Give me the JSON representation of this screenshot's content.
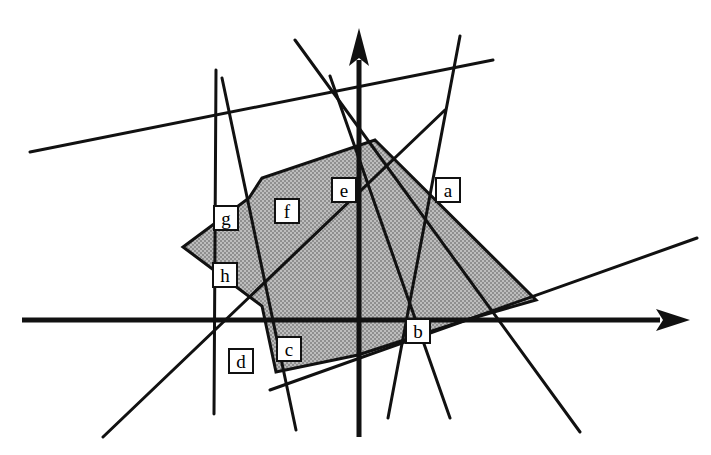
{
  "figure": {
    "kind": "geometry-diagram",
    "background_color": "#ffffff",
    "ink_color": "#111111",
    "fill_color": "#a8a8a8",
    "fill_pattern": "checker-hatch",
    "width": 711,
    "height": 455
  },
  "axes": {
    "origin": {
      "x": 358,
      "y": 320
    },
    "x_axis": {
      "name": "x-axis",
      "from": {
        "x": 22,
        "y": 320
      },
      "to": {
        "x": 660,
        "y": 320
      },
      "arrow_tip": {
        "x": 690,
        "y": 320
      },
      "stroke_width": 5,
      "arrow": "right"
    },
    "y_axis": {
      "name": "y-axis",
      "from": {
        "x": 359,
        "y": 437
      },
      "to": {
        "x": 359,
        "y": 60
      },
      "arrow_tip": {
        "x": 359,
        "y": 28
      },
      "stroke_width": 5,
      "arrow": "up"
    }
  },
  "polygon": {
    "name": "feasible-region",
    "fill": "#a8a8a8",
    "stroke": "#111111",
    "stroke_width": 3,
    "vertices": [
      {
        "id": "apex",
        "x": 375,
        "y": 140
      },
      {
        "id": "right",
        "x": 536,
        "y": 300
      },
      {
        "id": "x-axis-right",
        "x": 466,
        "y": 320
      },
      {
        "id": "bottom",
        "x": 358,
        "y": 355
      },
      {
        "id": "lower-left",
        "x": 276,
        "y": 372
      },
      {
        "id": "notch",
        "x": 262,
        "y": 306
      },
      {
        "id": "left",
        "x": 183,
        "y": 247
      },
      {
        "id": "upper-left",
        "x": 249,
        "y": 198
      },
      {
        "id": "upper-mid",
        "x": 262,
        "y": 178
      }
    ]
  },
  "lines": [
    {
      "id": "a",
      "label": "a",
      "role": "constraint-boundary",
      "from": {
        "x": 295,
        "y": 40
      },
      "to": {
        "x": 580,
        "y": 432
      },
      "stroke_width": 3
    },
    {
      "id": "b",
      "label": "b",
      "role": "constraint-boundary",
      "from": {
        "x": 270,
        "y": 390
      },
      "to": {
        "x": 697,
        "y": 238
      },
      "stroke_width": 3
    },
    {
      "id": "c",
      "label": "c",
      "role": "constraint-boundary",
      "from": {
        "x": 222,
        "y": 78
      },
      "to": {
        "x": 296,
        "y": 430
      },
      "stroke_width": 3
    },
    {
      "id": "d",
      "label": "d",
      "role": "constraint-boundary",
      "from": {
        "x": 216,
        "y": 70
      },
      "to": {
        "x": 214,
        "y": 414
      },
      "stroke_width": 3
    },
    {
      "id": "e",
      "label": "e",
      "role": "constraint-boundary",
      "from": {
        "x": 330,
        "y": 76
      },
      "to": {
        "x": 450,
        "y": 418
      },
      "stroke_width": 3
    },
    {
      "id": "f",
      "label": "f",
      "role": "constraint-boundary",
      "from": {
        "x": 460,
        "y": 36
      },
      "to": {
        "x": 388,
        "y": 418
      },
      "stroke_width": 3
    },
    {
      "id": "g",
      "label": "g",
      "role": "constraint-boundary",
      "from": {
        "x": 30,
        "y": 152
      },
      "to": {
        "x": 493,
        "y": 60
      },
      "stroke_width": 3
    },
    {
      "id": "h",
      "label": "h",
      "role": "constraint-boundary",
      "from": {
        "x": 103,
        "y": 437
      },
      "to": {
        "x": 445,
        "y": 110
      },
      "stroke_width": 3
    }
  ],
  "labels": [
    {
      "id": "a",
      "text": "a",
      "x": 435,
      "y": 177
    },
    {
      "id": "b",
      "text": "b",
      "x": 405,
      "y": 318
    },
    {
      "id": "c",
      "text": "c",
      "x": 276,
      "y": 336
    },
    {
      "id": "d",
      "text": "d",
      "x": 228,
      "y": 348
    },
    {
      "id": "e",
      "text": "e",
      "x": 331,
      "y": 177
    },
    {
      "id": "f",
      "text": "f",
      "x": 274,
      "y": 198
    },
    {
      "id": "g",
      "text": "g",
      "x": 213,
      "y": 205
    },
    {
      "id": "h",
      "text": "h",
      "x": 212,
      "y": 262
    }
  ]
}
